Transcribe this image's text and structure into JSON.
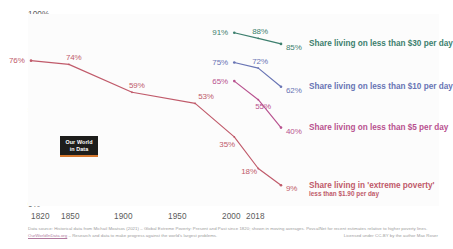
{
  "chart_data": {
    "type": "line",
    "title": "",
    "xlabel": "",
    "ylabel": "",
    "xlim": [
      1820,
      2018
    ],
    "ylim": [
      0,
      100
    ],
    "grid": false,
    "legend_position": "right-inline-annotations",
    "y_ticks": [
      "0%",
      "50%",
      "100%"
    ],
    "y_tick_values": [
      0,
      50,
      100
    ],
    "x_ticks": [
      "1820",
      "1850",
      "1900",
      "1950",
      "2000",
      "2018"
    ],
    "x_tick_values": [
      1820,
      1850,
      1900,
      1950,
      2000,
      2018
    ],
    "series": [
      {
        "name": "Share living on less than $30 per day",
        "color": "#3d7f6e",
        "x": [
          1981,
          2000,
          2018
        ],
        "values": [
          91,
          88,
          85
        ],
        "labels": [
          "91%",
          "88%",
          "85%"
        ],
        "end_label": "Share living on less than $30 per day",
        "end_sublabel": ""
      },
      {
        "name": "Share living on less than $10 per day",
        "color": "#6874b4",
        "x": [
          1981,
          2000,
          2018
        ],
        "values": [
          75,
          72,
          62
        ],
        "labels": [
          "75%",
          "72%",
          "62%"
        ],
        "end_label": "Share living on less than $10 per day",
        "end_sublabel": ""
      },
      {
        "name": "Share living on less than $5 per day",
        "color": "#b8528f",
        "x": [
          1981,
          2000,
          2018
        ],
        "values": [
          65,
          55,
          40
        ],
        "labels": [
          "65%",
          "55%",
          "40%"
        ],
        "end_label": "Share living on less than $5 per day",
        "end_sublabel": ""
      },
      {
        "name": "Share living in 'extreme poverty'",
        "color": "#c05a6a",
        "x": [
          1820,
          1850,
          1900,
          1950,
          1981,
          2000,
          2018
        ],
        "values": [
          76,
          74,
          59,
          53,
          35,
          18,
          9
        ],
        "labels": [
          "76%",
          "74%",
          "59%",
          "53%",
          "35%",
          "18%",
          "9%"
        ],
        "end_label": "Share living in 'extreme poverty'",
        "end_sublabel": "less than $1.90 per day"
      }
    ]
  },
  "logo": {
    "line1": "Our World",
    "line2": "in Data"
  },
  "footer": {
    "line1": "Data source: Historical data from Michail Moatsos (2021) – Global Extreme Poverty: Present and Past since 1820; shown in moving averages. PovcalNet for recent estimates relative to higher poverty lines.",
    "owid_link": "OurWorldInData.org",
    "line2_rest": " – Research and data to make progress against the world's largest problems.",
    "license": "Licensed under CC-BY by the author Max Roser"
  },
  "colors": {
    "extreme_poverty": "#c05a6a",
    "five_dollar": "#b8528f",
    "ten_dollar": "#6874b4",
    "thirty_dollar": "#3d7f6e",
    "logo_accent": "#d4772e",
    "axis_text": "#5b5b5b",
    "footer_text": "#9b9b9b"
  }
}
